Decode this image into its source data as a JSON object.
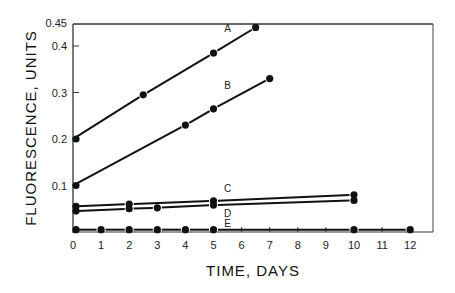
{
  "chart_data": {
    "type": "line",
    "title": "",
    "xlabel": "TIME, DAYS",
    "ylabel": "FLUORESCENCE, UNITS",
    "xlim": [
      0,
      13
    ],
    "ylim": [
      0,
      0.45
    ],
    "x_ticks": [
      0,
      1,
      2,
      3,
      4,
      5,
      6,
      7,
      8,
      9,
      10,
      11,
      12
    ],
    "x_tick_labels": [
      "0",
      "1",
      "2",
      "3",
      "4",
      "5",
      "6",
      "7",
      "8",
      "9",
      "10",
      "11",
      "12"
    ],
    "y_ticks": [
      0.1,
      0.2,
      0.3,
      0.4,
      0.45
    ],
    "y_tick_labels": [
      "0.1",
      "0.2",
      "0.3",
      "0.4",
      "0.45"
    ],
    "grid": false,
    "legend": "inline series labels",
    "series": [
      {
        "name": "A",
        "x": [
          0,
          2.5,
          5,
          6.5
        ],
        "y": [
          0.2,
          0.295,
          0.385,
          0.44
        ]
      },
      {
        "name": "B",
        "x": [
          0,
          4,
          5,
          7
        ],
        "y": [
          0.1,
          0.23,
          0.265,
          0.33
        ]
      },
      {
        "name": "C",
        "x": [
          0,
          2,
          5,
          10
        ],
        "y": [
          0.055,
          0.06,
          0.067,
          0.08
        ]
      },
      {
        "name": "D",
        "x": [
          0,
          2,
          3,
          5,
          10
        ],
        "y": [
          0.045,
          0.05,
          0.052,
          0.058,
          0.068
        ]
      },
      {
        "name": "E",
        "x": [
          0,
          1,
          2,
          3,
          4,
          5,
          10,
          12
        ],
        "y": [
          0.005,
          0.005,
          0.005,
          0.005,
          0.005,
          0.005,
          0.005,
          0.005
        ]
      }
    ]
  }
}
